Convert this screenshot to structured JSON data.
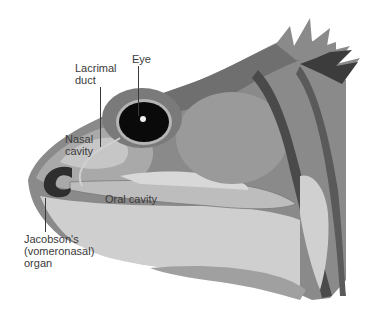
{
  "figure": {
    "colors": {
      "background": "#ffffff",
      "skin_dark": "#6f6f6f",
      "skin_mid": "#8a8a8a",
      "skin_light": "#a9a9a9",
      "tissue_pale": "#c6c6c6",
      "tissue_paler": "#d4d4d4",
      "organ_dark": "#2e2e2e",
      "eye_black": "#0a0a0a",
      "label_text": "#3a3a3a"
    }
  },
  "labels": {
    "lacrimal_duct": "Lacrimal\nduct",
    "eye": "Eye",
    "nasal_cavity": "Nasal\ncavity",
    "oral_cavity": "Oral cavity",
    "jacobsons_organ": "Jacobson's\n(vomeronasal)\norgan"
  }
}
